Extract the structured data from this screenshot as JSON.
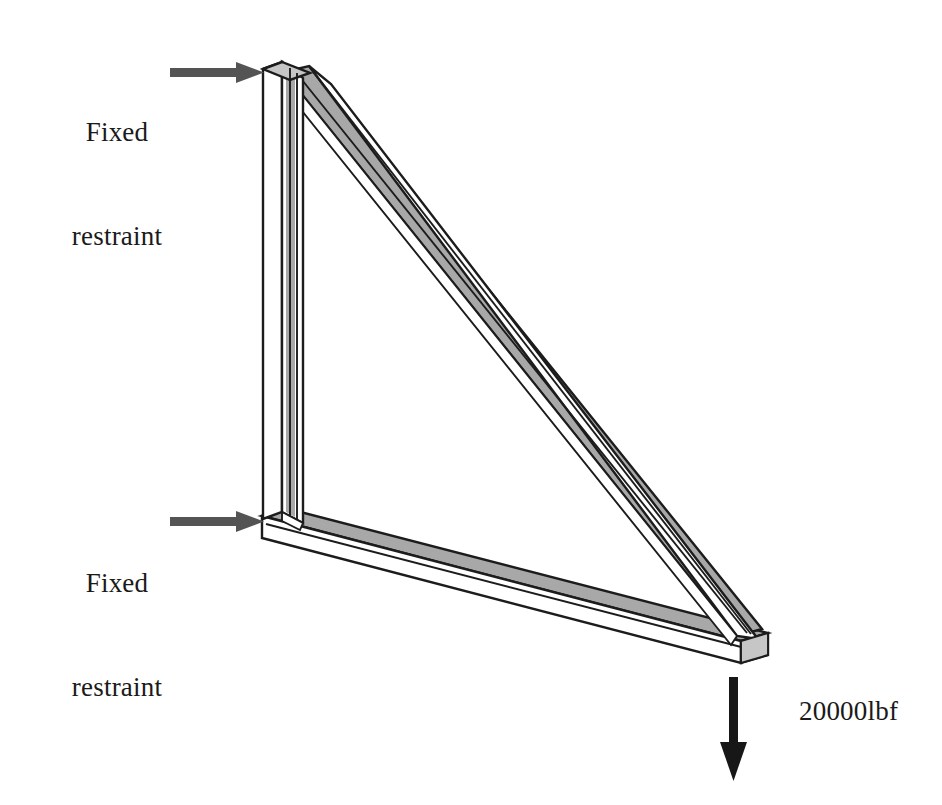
{
  "figure": {
    "type": "engineering-diagram",
    "background_color": "#ffffff"
  },
  "annotations": {
    "fixed_restraint_top": {
      "line1": "Fixed",
      "line2": "restraint",
      "text": "Fixed\nrestraint",
      "arrow_direction": "right",
      "arrow_color": "#545454",
      "target": "top-vertex-of-vertical-beam"
    },
    "fixed_restraint_bottom": {
      "line1": "Fixed",
      "line2": "restraint",
      "text": "Fixed\nrestraint",
      "arrow_direction": "right",
      "arrow_color": "#545454",
      "target": "bottom-left-corner-joint"
    },
    "applied_load": {
      "text": "20000lbf",
      "magnitude": "20000",
      "unit": "lbf",
      "arrow_direction": "down",
      "arrow_color": "#171717",
      "target": "bottom-right-free-end"
    }
  },
  "members": [
    {
      "name": "vertical-beam",
      "orientation": "vertical",
      "face_front_color": "#ffffff",
      "face_side_color": "#a8a8a8",
      "outline_color": "#1c1c1c"
    },
    {
      "name": "horizontal-beam",
      "orientation": "horizontal-lower-chord",
      "face_top_color": "#a8a8a8",
      "face_front_color": "#ffffff",
      "outline_color": "#1c1c1c"
    },
    {
      "name": "diagonal-beam",
      "orientation": "hypotenuse",
      "face_top_color": "#a8a8a8",
      "face_front_color": "#ffffff",
      "outline_color": "#1c1c1c"
    }
  ],
  "colors": {
    "stroke": "#1c1c1c",
    "shade_gray": "#a8a8a8",
    "shade_gray_light": "#c9c9c9",
    "white_face": "#ffffff",
    "arrow_gray": "#545454",
    "arrow_black": "#171717",
    "text": "#1a1a1a"
  }
}
